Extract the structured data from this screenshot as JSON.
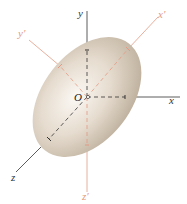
{
  "diagram": {
    "type": "ellipsoid-principal-axes",
    "origin": {
      "label": "O",
      "x": 87,
      "y": 97
    },
    "ellipsoid": {
      "cx": 87,
      "cy": 97,
      "rx": 68,
      "ry": 44,
      "rotation_deg": -52,
      "fill_light": "#f7f1ea",
      "fill_dark": "#bcae9b"
    },
    "axes": [
      {
        "name": "y",
        "label": "y",
        "color": "#333333",
        "x2": 87,
        "y2": 11,
        "lx": 78,
        "ly": 17
      },
      {
        "name": "x",
        "label": "x",
        "color": "#333333",
        "x2": 180,
        "y2": 97,
        "lx": 169,
        "ly": 104
      },
      {
        "name": "z",
        "label": "z",
        "color": "#333333",
        "x2": 16,
        "y2": 172,
        "lx": 11,
        "ly": 181
      },
      {
        "name": "x-prime",
        "label": "x′",
        "color": "#e29a84",
        "x2": 158,
        "y2": 17,
        "lx": 159,
        "ly": 17
      },
      {
        "name": "y-prime",
        "label": "y′",
        "color": "#e29a84",
        "x2": 29,
        "y2": 40,
        "lx": 18,
        "ly": 37
      },
      {
        "name": "z-prime",
        "label": "z′",
        "color": "#e29a84",
        "x2": 87,
        "y2": 192,
        "lx": 82,
        "ly": 200
      }
    ],
    "colors": {
      "axis": "#333333",
      "principal_axis": "#e29a84",
      "background": "#ffffff"
    }
  }
}
